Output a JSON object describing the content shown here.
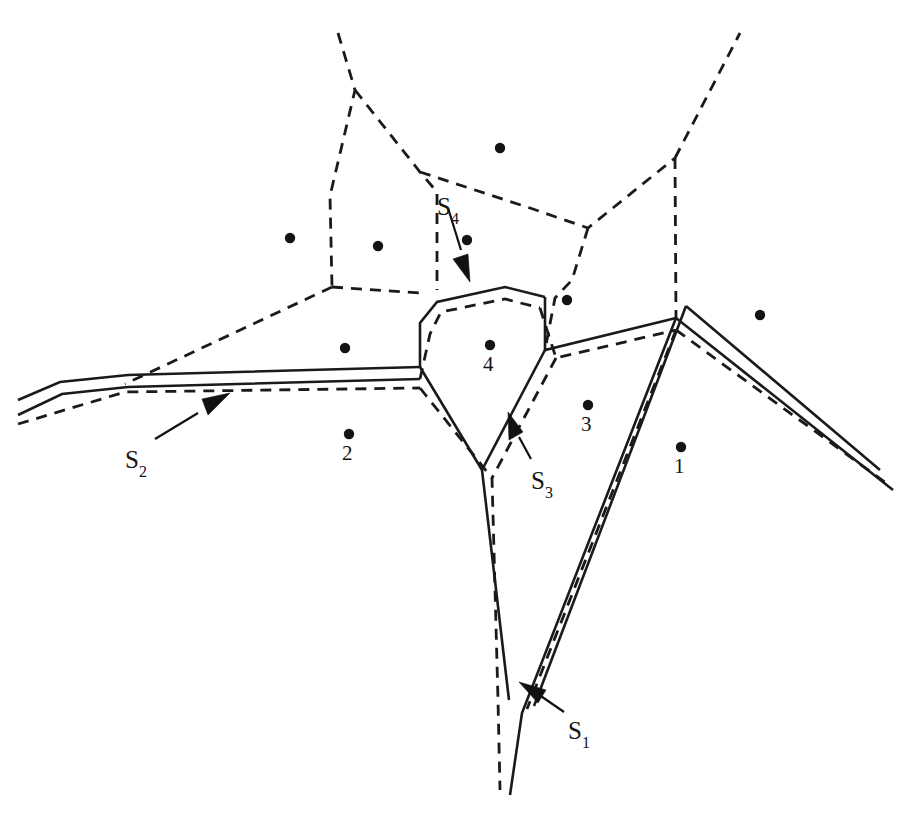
{
  "figure": {
    "background_color": "#ffffff",
    "line_color": "#1a1a1a",
    "width": 911,
    "height": 819
  },
  "sites": [
    {
      "id": "site-1",
      "label": "1",
      "x": 681,
      "y": 447,
      "label_x": 674,
      "label_y": 456
    },
    {
      "id": "site-2",
      "label": "2",
      "x": 349,
      "y": 434,
      "label_x": 342,
      "label_y": 443
    },
    {
      "id": "site-3",
      "label": "3",
      "x": 588,
      "y": 405,
      "label_x": 581,
      "label_y": 414
    },
    {
      "id": "site-4",
      "label": "4",
      "x": 490,
      "y": 345,
      "label_x": 483,
      "label_y": 354
    }
  ],
  "unlabeled_sites": [
    {
      "id": "site-dot-a",
      "x": 500,
      "y": 148
    },
    {
      "id": "site-dot-b",
      "x": 290,
      "y": 238
    },
    {
      "id": "site-dot-c",
      "x": 378,
      "y": 246
    },
    {
      "id": "site-dot-d",
      "x": 467,
      "y": 240
    },
    {
      "id": "site-dot-e",
      "x": 567,
      "y": 300
    },
    {
      "id": "site-dot-f",
      "x": 760,
      "y": 315
    },
    {
      "id": "site-dot-g",
      "x": 345,
      "y": 348
    }
  ],
  "corridor_labels": [
    {
      "id": "label-s1",
      "base": "S",
      "sub": "1",
      "x": 568,
      "y": 718
    },
    {
      "id": "label-s2",
      "base": "S",
      "sub": "2",
      "x": 125,
      "y": 447
    },
    {
      "id": "label-s3",
      "base": "S",
      "sub": "3",
      "x": 531,
      "y": 468
    },
    {
      "id": "label-s4",
      "base": "S",
      "sub": "4",
      "x": 437,
      "y": 194
    }
  ],
  "voronoi_edges": [
    {
      "id": "edge-top-left-spine",
      "points": "338,33 355,90 330,196 332,287"
    },
    {
      "id": "edge-top-mid",
      "points": "355,90 420,172 437,192 437,290"
    },
    {
      "id": "edge-top-right-long",
      "points": "420,172 530,208 588,228 675,158"
    },
    {
      "id": "edge-top-right-up",
      "points": "675,158 740,33"
    },
    {
      "id": "edge-right-down",
      "points": "675,158 676,318"
    },
    {
      "id": "edge-mid-right-down",
      "points": "588,228 572,280 555,298 545,350"
    },
    {
      "id": "edge-left-fan",
      "points": "332,287 125,384"
    },
    {
      "id": "edge-left-corner-down",
      "points": "332,287 420,293"
    }
  ],
  "corridors": [
    {
      "id": "corridor-s2-west",
      "name": "S2 western corridor",
      "solid_outer": "18,400 60,382 128,375 420,367",
      "solid_inner": "18,415 62,394 128,387 420,379",
      "dashed_center": "18,424 125,392 420,388"
    },
    {
      "id": "corridor-s4-north",
      "name": "S4 northern corridor",
      "solid": "420,367 420,323 437,302 505,287 545,297",
      "dashed": "420,379 430,334 441,312 505,299 540,308"
    },
    {
      "id": "corridor-s3-east",
      "name": "S3 eastern corridor",
      "solid": "545,297 545,350 676,318",
      "dashed": "540,308 556,358 676,330"
    },
    {
      "id": "corridor-s3-southwest",
      "name": "S3 southwestern corridor",
      "solid": "545,350 482,470",
      "dashed": "556,358 492,478"
    },
    {
      "id": "corridor-s1-east-branch",
      "name": "S1 eastern branch",
      "solid_outer": "676,318 893,490",
      "solid_inner": "686,306 880,470",
      "dashed_center": "676,330 886,483"
    },
    {
      "id": "corridor-s1-descend",
      "name": "S1 descending branch",
      "solid_outer": "676,318 522,713 510,795",
      "solid_inner": "686,306 534,706",
      "dashed_center": "676,330 527,709"
    },
    {
      "id": "corridor-s1-west-descend",
      "name": "S1 western descending branch",
      "solid": "420,367 482,470 509,700",
      "dashed": "420,388 492,478 498,700 500,790"
    }
  ],
  "annotations": [
    {
      "id": "arrow-s1",
      "leader": "564,712 535,692",
      "arrow_tip": "519,682",
      "arrow_poly": "519,682 546,690 538,703"
    },
    {
      "id": "arrow-s2",
      "leader": "155,439 198,413",
      "arrow_tip": "230,393",
      "arrow_poly": "230,393 202,399 208,415"
    },
    {
      "id": "arrow-s3",
      "leader": "531,459 519,437",
      "arrow_tip": "508,412",
      "arrow_poly": "508,412 509,440 523,432"
    },
    {
      "id": "arrow-s4",
      "leader": "448,208 461,250",
      "arrow_tip": "470,282",
      "arrow_poly": "470,282 453,259 468,254"
    }
  ]
}
